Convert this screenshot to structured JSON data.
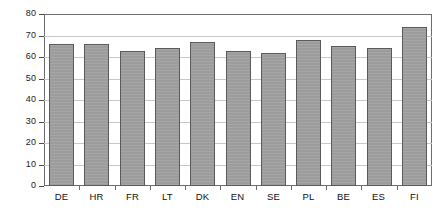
{
  "chart_data": {
    "type": "bar",
    "title": "",
    "subtitle": "",
    "xlabel": "",
    "ylabel": "",
    "categories": [
      "DE",
      "HR",
      "FR",
      "LT",
      "DK",
      "EN",
      "SE",
      "PL",
      "BE",
      "ES",
      "FI"
    ],
    "values": [
      66,
      66,
      63,
      64,
      67,
      63,
      62,
      68,
      65,
      64,
      74
    ],
    "ylim": [
      0,
      80
    ],
    "ytick_labels": [
      "0",
      "10",
      "20",
      "30",
      "40",
      "50",
      "60",
      "70",
      "80"
    ],
    "ytick_values": [
      0,
      10,
      20,
      30,
      40,
      50,
      60,
      70,
      80
    ],
    "grid": true,
    "grid_axis": "y",
    "legend": false,
    "legend_position": "none",
    "series": [
      {
        "name": "",
        "values": [
          66,
          66,
          63,
          64,
          67,
          63,
          62,
          68,
          65,
          64,
          74
        ]
      }
    ],
    "colors": {
      "bar_fill": "#9c9c9c",
      "bar_border": "#5a5a5a",
      "gridline": "#c8c8c8",
      "axis": "#6d6d6d",
      "text": "#111111",
      "background": "#ffffff"
    }
  }
}
